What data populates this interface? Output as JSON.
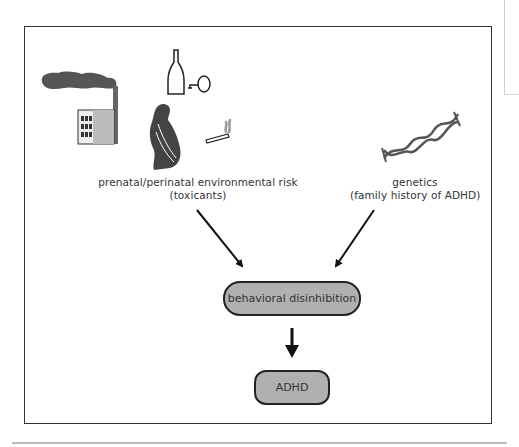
{
  "diagram": {
    "sources": [
      {
        "id": "environmental",
        "label_line1": "prenatal/perinatal  environmental risk",
        "label_line2": "(toxicants)",
        "icons": [
          "factory-smoke-icon",
          "wine-bottle-glass-icon",
          "pregnant-woman-icon",
          "cigarette-icon"
        ]
      },
      {
        "id": "genetics",
        "label_line1": "genetics",
        "label_line2": "(family history of ADHD)",
        "icons": [
          "dna-helix-icon"
        ]
      }
    ],
    "intermediate": {
      "label": "behavioral disinhibition",
      "fill": "#b0b0b0"
    },
    "outcome": {
      "label": "ADHD",
      "fill": "#b0b0b0"
    },
    "edges": [
      {
        "from": "environmental",
        "to": "intermediate"
      },
      {
        "from": "genetics",
        "to": "intermediate"
      },
      {
        "from": "intermediate",
        "to": "outcome"
      }
    ]
  }
}
